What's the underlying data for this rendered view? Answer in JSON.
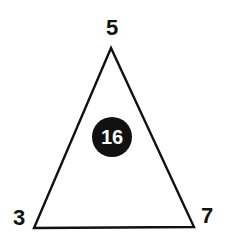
{
  "diagram": {
    "type": "number-triangle-puzzle",
    "vertices": {
      "top": "5",
      "bottom_left": "3",
      "bottom_right": "7"
    },
    "center": "16",
    "colors": {
      "stroke": "#111111",
      "circle_fill": "#111111",
      "center_text": "#ffffff",
      "background": "#ffffff"
    }
  }
}
